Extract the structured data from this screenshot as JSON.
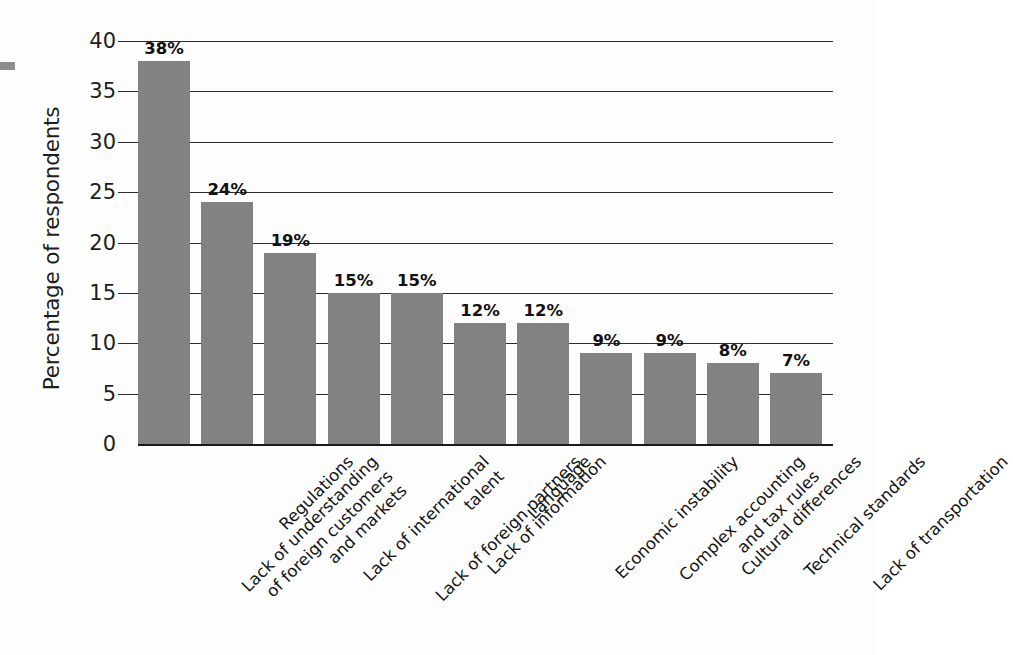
{
  "chart_data": {
    "type": "bar",
    "title": "",
    "subtitle": "",
    "xlabel": "",
    "ylabel": "Percentage of respondents",
    "ylim": [
      0,
      40
    ],
    "ytick_step": 5,
    "yticks": [
      "0",
      "5",
      "10",
      "15",
      "20",
      "25",
      "30",
      "35",
      "40"
    ],
    "grid": true,
    "legend": "none",
    "value_suffix": "%",
    "bar_color": "#828282",
    "axis_color": "#2b2b2b",
    "categories": [
      "Lack of understanding of foreign customers and markets",
      "Regulations",
      "Lack of international talent",
      "Lack of foreign partners",
      "Lack of information",
      "Language",
      "Economic instability",
      "Complex accounting and tax rules",
      "Cultural differences",
      "Technical standards",
      "Lack of transportation"
    ],
    "category_lines": [
      [
        "Lack of understanding",
        "of foreign customers",
        "and markets"
      ],
      [
        "Regulations"
      ],
      [
        "Lack of international",
        "talent"
      ],
      [
        "Lack of foreign partners"
      ],
      [
        "Lack of information"
      ],
      [
        "Language"
      ],
      [
        "Economic instability"
      ],
      [
        "Complex accounting",
        "and tax rules"
      ],
      [
        "Cultural differences"
      ],
      [
        "Technical standards"
      ],
      [
        "Lack of transportation"
      ]
    ],
    "values": [
      38,
      24,
      19,
      15,
      15,
      12,
      12,
      9,
      9,
      8,
      7
    ],
    "value_labels": [
      "38%",
      "24%",
      "19%",
      "15%",
      "15%",
      "12%",
      "12%",
      "9%",
      "9%",
      "8%",
      "7%"
    ]
  }
}
